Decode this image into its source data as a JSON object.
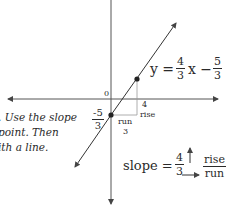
{
  "instructions": {
    "lines": [
      ". Use the slope",
      "point. Then",
      "ith a line."
    ]
  },
  "equation": {
    "lhs": "y =",
    "coef_num": "4",
    "coef_den": "3",
    "var": "x −",
    "const_num": "5",
    "const_den": "3"
  },
  "axis_labels": {
    "origin": "0"
  },
  "y_intercept": {
    "num": "-5",
    "den": "3"
  },
  "triangle": {
    "rise_value": "4",
    "rise_label": "rise",
    "run_label": "run",
    "run_value": "3"
  },
  "slope": {
    "label": "slope =",
    "num": "4",
    "den": "3",
    "rise": "rise",
    "run": "run"
  },
  "colors": {
    "ink": "#2a2a2a",
    "axis": "#555555",
    "guide": "#9a9a9a"
  }
}
